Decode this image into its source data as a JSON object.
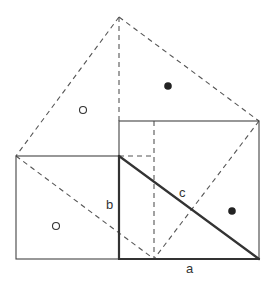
{
  "diagram": {
    "labels": {
      "a": "a",
      "b": "b",
      "c": "c"
    },
    "markers": {
      "open_circle": "open-circle",
      "filled_circle": "filled-circle"
    },
    "colors": {
      "line": "#444444",
      "thick_line": "#333333",
      "dash": "#555555",
      "background": "#ffffff"
    }
  }
}
